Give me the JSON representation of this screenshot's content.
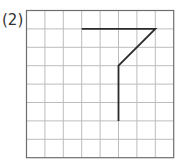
{
  "label": "(2)",
  "grid": {
    "cols": 8,
    "rows": 8,
    "origin_x": 26.5,
    "origin_y": 10.5,
    "cell": 18.4,
    "line_color": "#bdbdbd",
    "border_color": "#6e6e6e"
  },
  "figure": {
    "stroke_color": "#2a2a2a",
    "points": [
      [
        3,
        1
      ],
      [
        7,
        1
      ],
      [
        5,
        3
      ],
      [
        5,
        6
      ]
    ]
  }
}
